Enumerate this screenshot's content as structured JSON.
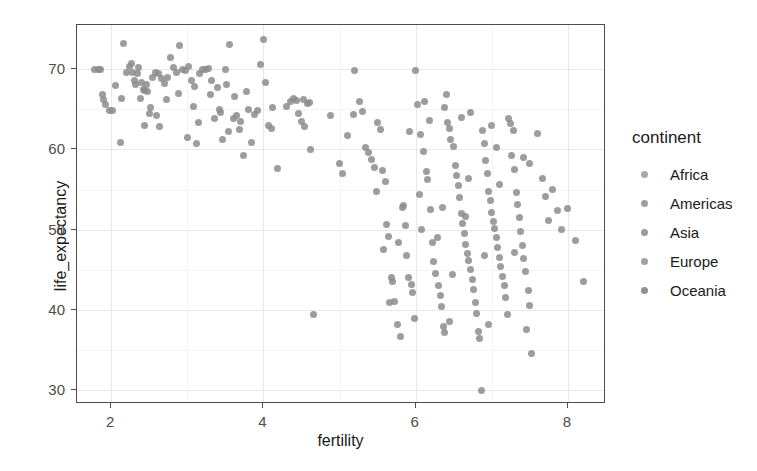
{
  "chart_data": {
    "type": "scatter",
    "title": "",
    "xlabel": "fertility",
    "ylabel": "life_expectancy",
    "xlim": [
      1.55,
      8.5
    ],
    "ylim": [
      28.3,
      75.5
    ],
    "xticks": [
      2,
      4,
      6,
      8
    ],
    "yticks": [
      30,
      40,
      50,
      60,
      70
    ],
    "xminor": [
      3,
      5,
      7
    ],
    "yminor": [
      35,
      45,
      55,
      65
    ],
    "grid": true,
    "legend": {
      "position": "right",
      "title": "continent",
      "entries": [
        {
          "label": "Africa",
          "color": "#9a9a9a"
        },
        {
          "label": "Americas",
          "color": "#8e8e8e"
        },
        {
          "label": "Asia",
          "color": "#888888"
        },
        {
          "label": "Europe",
          "color": "#909090"
        },
        {
          "label": "Oceania",
          "color": "#7d7d7d"
        }
      ]
    },
    "point_color": "#8c8c8c",
    "point_size": 7,
    "points": [
      [
        1.78,
        69.9
      ],
      [
        1.83,
        70.0
      ],
      [
        1.86,
        69.9
      ],
      [
        1.88,
        66.9
      ],
      [
        1.9,
        66.2
      ],
      [
        1.93,
        65.6
      ],
      [
        1.98,
        64.9
      ],
      [
        2.02,
        64.8
      ],
      [
        2.12,
        60.9
      ],
      [
        2.16,
        73.2
      ],
      [
        2.2,
        69.6
      ],
      [
        2.24,
        70.3
      ],
      [
        2.26,
        70.7
      ],
      [
        2.28,
        69.6
      ],
      [
        2.3,
        68.6
      ],
      [
        2.32,
        68.1
      ],
      [
        2.34,
        69.4
      ],
      [
        2.36,
        70.2
      ],
      [
        2.4,
        68.3
      ],
      [
        2.42,
        67.5
      ],
      [
        2.44,
        67.4
      ],
      [
        2.46,
        68.1
      ],
      [
        2.48,
        67.2
      ],
      [
        2.5,
        64.5
      ],
      [
        2.54,
        69.0
      ],
      [
        2.58,
        69.6
      ],
      [
        2.62,
        69.4
      ],
      [
        2.66,
        68.8
      ],
      [
        2.7,
        68.2
      ],
      [
        2.74,
        68.9
      ],
      [
        2.78,
        71.4
      ],
      [
        2.82,
        70.2
      ],
      [
        2.86,
        69.6
      ],
      [
        2.9,
        73.0
      ],
      [
        2.94,
        69.9
      ],
      [
        2.98,
        69.8
      ],
      [
        3.0,
        61.5
      ],
      [
        3.02,
        70.3
      ],
      [
        3.06,
        68.6
      ],
      [
        3.1,
        67.9
      ],
      [
        3.12,
        60.8
      ],
      [
        3.16,
        69.4
      ],
      [
        3.2,
        70.0
      ],
      [
        3.24,
        69.9
      ],
      [
        3.28,
        70.1
      ],
      [
        3.32,
        68.6
      ],
      [
        3.36,
        63.9
      ],
      [
        3.4,
        67.7
      ],
      [
        3.44,
        64.6
      ],
      [
        3.46,
        61.3
      ],
      [
        3.5,
        70.0
      ],
      [
        3.52,
        68.1
      ],
      [
        3.56,
        73.1
      ],
      [
        3.6,
        63.9
      ],
      [
        3.64,
        64.2
      ],
      [
        3.68,
        62.5
      ],
      [
        3.7,
        63.5
      ],
      [
        3.74,
        59.3
      ],
      [
        3.8,
        65.0
      ],
      [
        3.84,
        60.9
      ],
      [
        3.88,
        64.3
      ],
      [
        3.92,
        64.8
      ],
      [
        3.96,
        70.6
      ],
      [
        4.0,
        73.7
      ],
      [
        4.02,
        68.4
      ],
      [
        4.06,
        63.0
      ],
      [
        4.1,
        62.6
      ],
      [
        4.18,
        57.6
      ],
      [
        4.36,
        66.0
      ],
      [
        4.4,
        66.4
      ],
      [
        4.44,
        66.1
      ],
      [
        4.46,
        64.5
      ],
      [
        4.5,
        63.5
      ],
      [
        4.54,
        62.9
      ],
      [
        4.58,
        65.7
      ],
      [
        4.6,
        65.8
      ],
      [
        4.62,
        60.0
      ],
      [
        4.66,
        39.5
      ],
      [
        4.88,
        64.2
      ],
      [
        5.0,
        58.2
      ],
      [
        5.04,
        57.0
      ],
      [
        5.1,
        61.8
      ],
      [
        5.2,
        69.8
      ],
      [
        5.26,
        66.0
      ],
      [
        5.3,
        64.7
      ],
      [
        5.34,
        60.3
      ],
      [
        5.38,
        59.6
      ],
      [
        5.42,
        58.8
      ],
      [
        5.46,
        57.8
      ],
      [
        5.5,
        63.3
      ],
      [
        5.54,
        62.5
      ],
      [
        5.56,
        57.4
      ],
      [
        5.6,
        56.0
      ],
      [
        5.62,
        50.6
      ],
      [
        5.64,
        49.2
      ],
      [
        5.68,
        44.1
      ],
      [
        5.7,
        43.5
      ],
      [
        5.72,
        41.1
      ],
      [
        5.76,
        38.2
      ],
      [
        5.8,
        36.7
      ],
      [
        5.84,
        53.0
      ],
      [
        5.86,
        50.5
      ],
      [
        5.88,
        46.8
      ],
      [
        5.9,
        44.0
      ],
      [
        5.94,
        43.2
      ],
      [
        5.96,
        42.2
      ],
      [
        6.0,
        69.8
      ],
      [
        6.02,
        65.6
      ],
      [
        6.06,
        61.9
      ],
      [
        6.1,
        59.8
      ],
      [
        6.14,
        57.3
      ],
      [
        6.16,
        56.2
      ],
      [
        6.2,
        52.5
      ],
      [
        6.22,
        48.4
      ],
      [
        6.24,
        46.0
      ],
      [
        6.26,
        44.5
      ],
      [
        6.3,
        43.0
      ],
      [
        6.32,
        41.8
      ],
      [
        6.34,
        40.4
      ],
      [
        6.36,
        38.0
      ],
      [
        6.38,
        37.2
      ],
      [
        6.4,
        66.8
      ],
      [
        6.42,
        63.4
      ],
      [
        6.44,
        62.6
      ],
      [
        6.46,
        61.2
      ],
      [
        6.5,
        60.4
      ],
      [
        6.52,
        58.0
      ],
      [
        6.54,
        56.8
      ],
      [
        6.56,
        55.5
      ],
      [
        6.58,
        54.0
      ],
      [
        6.6,
        52.0
      ],
      [
        6.62,
        50.8
      ],
      [
        6.64,
        49.5
      ],
      [
        6.66,
        48.2
      ],
      [
        6.68,
        47.0
      ],
      [
        6.7,
        46.2
      ],
      [
        6.72,
        45.0
      ],
      [
        6.74,
        43.8
      ],
      [
        6.76,
        42.6
      ],
      [
        6.78,
        41.0
      ],
      [
        6.8,
        39.6
      ],
      [
        6.82,
        37.3
      ],
      [
        6.84,
        36.5
      ],
      [
        6.86,
        30.0
      ],
      [
        6.88,
        62.3
      ],
      [
        6.9,
        60.7
      ],
      [
        6.92,
        58.6
      ],
      [
        6.94,
        57.0
      ],
      [
        6.96,
        54.8
      ],
      [
        6.98,
        53.6
      ],
      [
        7.0,
        52.2
      ],
      [
        7.02,
        51.0
      ],
      [
        7.04,
        50.2
      ],
      [
        7.06,
        49.0
      ],
      [
        7.08,
        47.8
      ],
      [
        7.1,
        46.6
      ],
      [
        7.12,
        45.4
      ],
      [
        7.14,
        44.2
      ],
      [
        7.16,
        43.0
      ],
      [
        7.18,
        41.6
      ],
      [
        7.2,
        39.4
      ],
      [
        7.22,
        63.8
      ],
      [
        7.24,
        63.2
      ],
      [
        7.26,
        59.2
      ],
      [
        7.3,
        57.5
      ],
      [
        7.32,
        54.6
      ],
      [
        7.34,
        53.2
      ],
      [
        7.36,
        51.5
      ],
      [
        7.38,
        49.8
      ],
      [
        7.4,
        48.0
      ],
      [
        7.42,
        46.4
      ],
      [
        7.44,
        44.8
      ],
      [
        7.48,
        42.4
      ],
      [
        7.5,
        40.6
      ],
      [
        7.52,
        34.6
      ],
      [
        7.6,
        62.0
      ],
      [
        7.66,
        56.4
      ],
      [
        7.7,
        54.2
      ],
      [
        7.74,
        51.2
      ],
      [
        7.8,
        55.0
      ],
      [
        7.86,
        52.4
      ],
      [
        7.92,
        50.0
      ],
      [
        8.0,
        52.6
      ],
      [
        8.1,
        48.6
      ],
      [
        8.2,
        43.6
      ],
      [
        2.06,
        68.0
      ],
      [
        2.14,
        66.4
      ],
      [
        2.38,
        66.3
      ],
      [
        2.52,
        65.2
      ],
      [
        2.6,
        64.2
      ],
      [
        2.72,
        66.2
      ],
      [
        2.88,
        67.0
      ],
      [
        3.08,
        65.4
      ],
      [
        3.3,
        66.8
      ],
      [
        3.42,
        65.0
      ],
      [
        3.62,
        66.6
      ],
      [
        3.78,
        67.2
      ],
      [
        4.12,
        65.2
      ],
      [
        4.52,
        66.2
      ],
      [
        5.18,
        64.4
      ],
      [
        5.48,
        54.8
      ],
      [
        5.78,
        48.4
      ],
      [
        6.08,
        50.0
      ],
      [
        6.28,
        49.0
      ],
      [
        6.48,
        44.4
      ],
      [
        6.7,
        56.4
      ],
      [
        6.9,
        46.8
      ],
      [
        7.1,
        55.6
      ],
      [
        7.3,
        47.2
      ],
      [
        7.5,
        58.2
      ],
      [
        5.92,
        62.2
      ],
      [
        6.18,
        63.6
      ],
      [
        6.6,
        64.0
      ],
      [
        7.0,
        63.0
      ],
      [
        7.28,
        62.4
      ],
      [
        5.58,
        47.6
      ],
      [
        5.82,
        52.8
      ],
      [
        6.05,
        54.4
      ],
      [
        6.35,
        52.8
      ],
      [
        6.65,
        51.6
      ],
      [
        5.66,
        41.0
      ],
      [
        5.98,
        39.0
      ],
      [
        6.45,
        38.6
      ],
      [
        6.95,
        38.2
      ],
      [
        7.45,
        37.6
      ],
      [
        2.44,
        63.0
      ],
      [
        2.64,
        62.8
      ],
      [
        3.14,
        63.4
      ],
      [
        3.54,
        62.2
      ],
      [
        4.3,
        65.4
      ],
      [
        6.12,
        66.0
      ],
      [
        6.38,
        65.2
      ],
      [
        6.72,
        64.6
      ],
      [
        7.06,
        60.2
      ],
      [
        7.42,
        59.0
      ]
    ]
  }
}
